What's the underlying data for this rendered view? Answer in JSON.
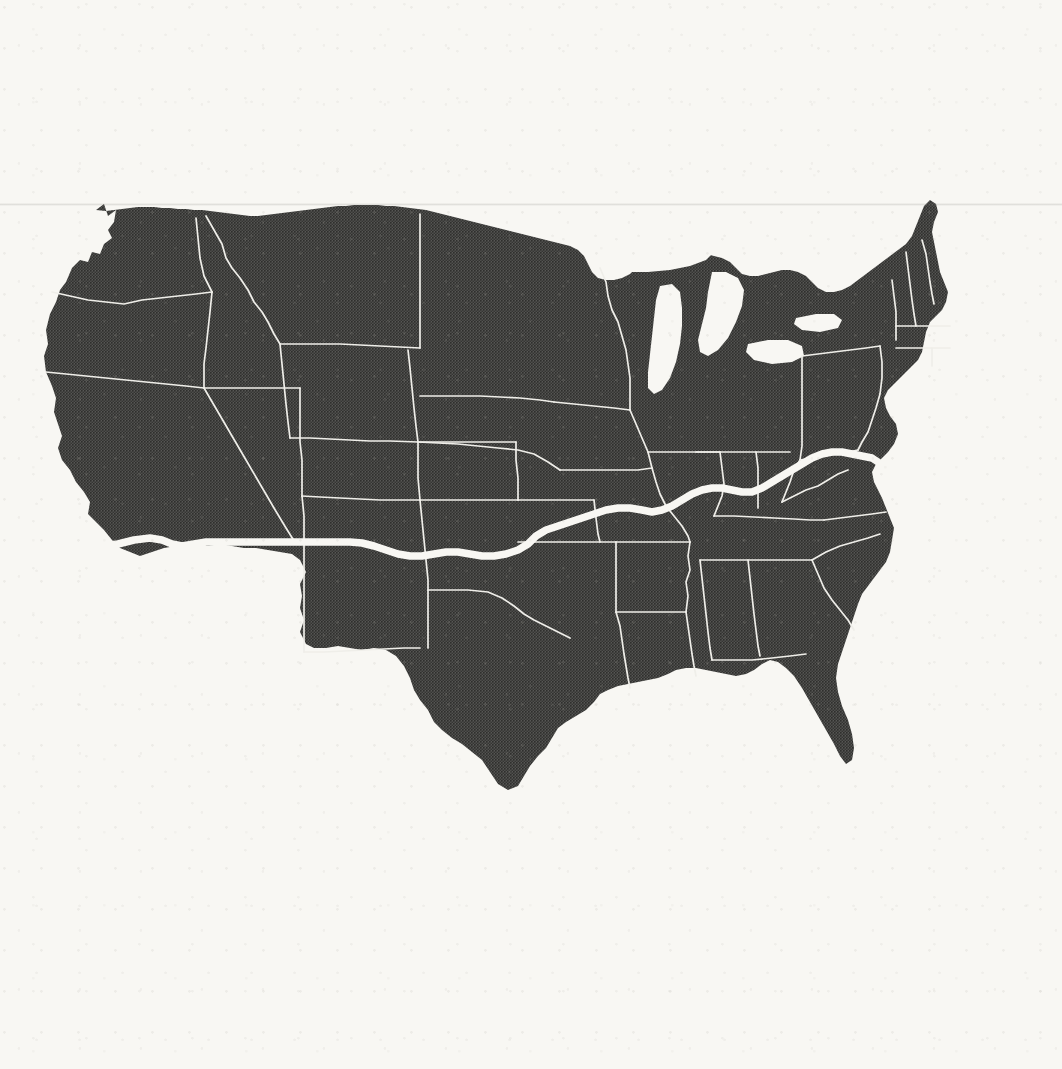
{
  "document": {
    "kind": "printed-map-scan",
    "title": "Contiguous United States",
    "caption": "",
    "medium": "halftone screened print on paper"
  },
  "map": {
    "region_name": "Contiguous United States",
    "projection_look": "conic",
    "fill_style": "halftone-screen",
    "bounding_box_px": {
      "x": 42,
      "y": 198,
      "width": 910,
      "height": 600
    },
    "artifacts": [
      {
        "name": "fold-crease",
        "orientation": "horizontal",
        "y_px": 203
      }
    ],
    "water_bodies": [
      {
        "name": "Lake Superior"
      },
      {
        "name": "Lake Michigan"
      },
      {
        "name": "Lake Huron"
      },
      {
        "name": "Lake Erie"
      },
      {
        "name": "Lake Ontario"
      },
      {
        "name": "Atlantic Ocean"
      },
      {
        "name": "Gulf of Mexico"
      },
      {
        "name": "Pacific Ocean"
      }
    ],
    "highlight_route": {
      "name": "transcontinental-highlight-line",
      "description": "Thick white line running from the Southern California coast east across the Southwest, then northeast along the Kentucky–Tennessee and Ohio River borders to the Virginia coast",
      "west_terminus": "Southern California coast",
      "east_terminus": "Virginia / Chesapeake coast",
      "stroke_color": "#f8f7f3",
      "stroke_width_px": 7.5
    }
  },
  "colors": {
    "paper_background": "#f8f7f3",
    "land_fill": "#4e4e4c",
    "halftone_dot": "#2e2e2c",
    "state_border": "#efeee9",
    "highlight_line": "#f8f7f3"
  },
  "states": [
    "Washington",
    "Oregon",
    "California",
    "Nevada",
    "Idaho",
    "Montana",
    "Wyoming",
    "Utah",
    "Arizona",
    "Colorado",
    "New Mexico",
    "North Dakota",
    "South Dakota",
    "Nebraska",
    "Kansas",
    "Oklahoma",
    "Texas",
    "Minnesota",
    "Iowa",
    "Missouri",
    "Arkansas",
    "Louisiana",
    "Wisconsin",
    "Illinois",
    "Michigan",
    "Indiana",
    "Ohio",
    "Kentucky",
    "Tennessee",
    "Mississippi",
    "Alabama",
    "Georgia",
    "Florida",
    "South Carolina",
    "North Carolina",
    "Virginia",
    "West Virginia",
    "Maryland",
    "Delaware",
    "Pennsylvania",
    "New Jersey",
    "New York",
    "Connecticut",
    "Rhode Island",
    "Massachusetts",
    "Vermont",
    "New Hampshire",
    "Maine"
  ]
}
